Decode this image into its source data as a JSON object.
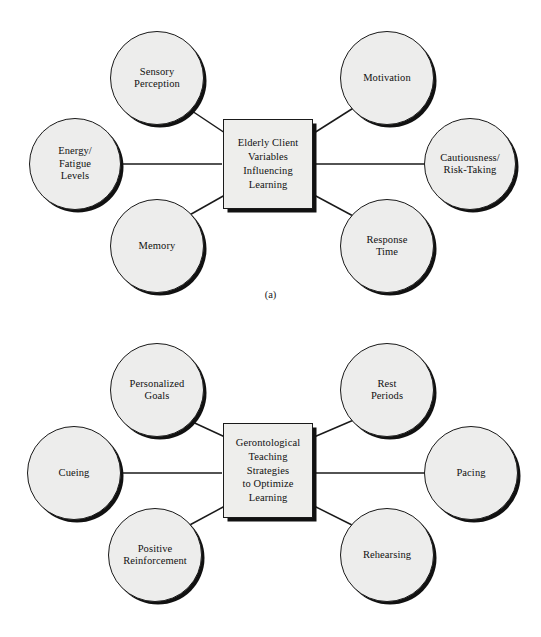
{
  "figure": {
    "background_color": "#ffffff",
    "node_fill": "#ededec",
    "node_stroke": "#1a1a1a",
    "shadow_color": "#111111"
  },
  "diagrams": [
    {
      "id": "a",
      "caption": "(a)",
      "center": {
        "name": "elderly-client-variables",
        "lines": [
          "Elderly Client",
          "Variables",
          "Influencing",
          "Learning"
        ],
        "text": "Elderly Client Variables Influencing Learning",
        "shape": "square",
        "x": 223,
        "y": 119,
        "w": 90,
        "h": 90
      },
      "nodes": [
        {
          "name": "sensory-perception",
          "lines": [
            "Sensory",
            "Perception"
          ],
          "text": "Sensory Perception",
          "x": 110,
          "y": 31,
          "d": 94,
          "position": "top-left"
        },
        {
          "name": "motivation",
          "lines": [
            "Motivation"
          ],
          "text": "Motivation",
          "x": 340,
          "y": 31,
          "d": 94,
          "position": "top-right"
        },
        {
          "name": "energy-fatigue-levels",
          "lines": [
            "Energy/",
            "Fatigue",
            "Levels"
          ],
          "text": "Energy/ Fatigue Levels",
          "x": 29,
          "y": 118,
          "d": 92,
          "position": "left"
        },
        {
          "name": "cautiousness-risk-taking",
          "lines": [
            "Cautiousness/",
            "Risk-Taking"
          ],
          "text": "Cautiousness/ Risk-Taking",
          "x": 424,
          "y": 118,
          "d": 92,
          "position": "right"
        },
        {
          "name": "memory",
          "lines": [
            "Memory"
          ],
          "text": "Memory",
          "x": 110,
          "y": 199,
          "d": 94,
          "position": "bottom-left"
        },
        {
          "name": "response-time",
          "lines": [
            "Response",
            "Time"
          ],
          "text": "Response Time",
          "x": 340,
          "y": 199,
          "d": 94,
          "position": "bottom-right"
        }
      ],
      "edges": [
        {
          "name": "edge-sensory-perception-to-center",
          "x1": 186,
          "y1": 107,
          "x2": 225,
          "y2": 133
        },
        {
          "name": "edge-motivation-to-center",
          "x1": 355,
          "y1": 107,
          "x2": 314,
          "y2": 133
        },
        {
          "name": "edge-energy-fatigue-to-center",
          "x1": 120,
          "y1": 164,
          "x2": 222,
          "y2": 164
        },
        {
          "name": "edge-cautiousness-to-center",
          "x1": 314,
          "y1": 164,
          "x2": 425,
          "y2": 164
        },
        {
          "name": "edge-memory-to-center",
          "x1": 186,
          "y1": 217,
          "x2": 225,
          "y2": 195
        },
        {
          "name": "edge-response-time-to-center",
          "x1": 355,
          "y1": 217,
          "x2": 314,
          "y2": 195
        }
      ]
    },
    {
      "id": "b",
      "caption": "(b)",
      "center": {
        "name": "gerontological-teaching-strategies",
        "lines": [
          "Gerontological",
          "Teaching",
          "Strategies",
          "to Optimize",
          "Learning"
        ],
        "text": "Gerontological Teaching Strategies to Optimize Learning",
        "shape": "square",
        "x": 223,
        "y": 423,
        "w": 90,
        "h": 95
      },
      "nodes": [
        {
          "name": "personalized-goals",
          "lines": [
            "Personalized",
            "Goals"
          ],
          "text": "Personalized Goals",
          "x": 110,
          "y": 343,
          "d": 94,
          "position": "top-left"
        },
        {
          "name": "rest-periods",
          "lines": [
            "Rest",
            "Periods"
          ],
          "text": "Rest Periods",
          "x": 340,
          "y": 343,
          "d": 94,
          "position": "top-right"
        },
        {
          "name": "cueing",
          "lines": [
            "Cueing"
          ],
          "text": "Cueing",
          "x": 27,
          "y": 426,
          "d": 94,
          "position": "left"
        },
        {
          "name": "pacing",
          "lines": [
            "Pacing"
          ],
          "text": "Pacing",
          "x": 424,
          "y": 426,
          "d": 94,
          "position": "right"
        },
        {
          "name": "positive-reinforcement",
          "lines": [
            "Positive",
            "Reinforcement"
          ],
          "text": "Positive Reinforcement",
          "x": 108,
          "y": 508,
          "d": 94,
          "position": "bottom-left"
        },
        {
          "name": "rehearsing",
          "lines": [
            "Rehearsing"
          ],
          "text": "Rehearsing",
          "x": 340,
          "y": 508,
          "d": 94,
          "position": "bottom-right"
        }
      ],
      "edges": [
        {
          "name": "edge-personalized-goals-to-center",
          "x1": 186,
          "y1": 419,
          "x2": 225,
          "y2": 437
        },
        {
          "name": "edge-rest-periods-to-center",
          "x1": 356,
          "y1": 419,
          "x2": 314,
          "y2": 437
        },
        {
          "name": "edge-cueing-to-center",
          "x1": 119,
          "y1": 473,
          "x2": 222,
          "y2": 473
        },
        {
          "name": "edge-pacing-to-center",
          "x1": 314,
          "y1": 473,
          "x2": 425,
          "y2": 473
        },
        {
          "name": "edge-positive-reinforcement-to-center",
          "x1": 186,
          "y1": 527,
          "x2": 225,
          "y2": 506
        },
        {
          "name": "edge-rehearsing-to-center",
          "x1": 356,
          "y1": 527,
          "x2": 314,
          "y2": 506
        }
      ]
    }
  ]
}
